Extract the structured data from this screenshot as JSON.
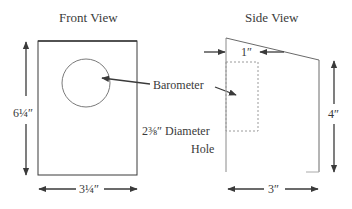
{
  "front_view": {
    "title": "Front View",
    "height_label": "6¼″",
    "width_label": "3¼″"
  },
  "side_view": {
    "title": "Side View",
    "top_offset_label": "1″",
    "height_label": "4″",
    "width_label": "3″"
  },
  "callouts": {
    "barometer": "Barometer",
    "hole_line1": "2⅜″ Diameter",
    "hole_line2": "Hole"
  },
  "colors": {
    "line": "#3a3a3a",
    "thin_line": "#8a8a8a",
    "dashed": "#9a9a9a"
  }
}
